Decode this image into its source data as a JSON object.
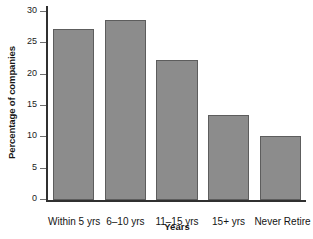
{
  "chart_data": {
    "type": "bar",
    "title": "",
    "xlabel": "Years",
    "ylabel": "Percentage of companies",
    "categories": [
      "Within 5 yrs",
      "6–10 yrs",
      "11–15 yrs",
      "15+ yrs",
      "Never Retire"
    ],
    "values": [
      27.3,
      28.8,
      22.4,
      13.6,
      10.2
    ],
    "ylim": [
      0,
      30
    ],
    "yticks": [
      0,
      5,
      10,
      15,
      20,
      25,
      30
    ],
    "ytick_labels": [
      "0",
      "5",
      "10",
      "15",
      "20",
      "25",
      "30"
    ],
    "grid": false,
    "legend": false,
    "bar_color": "#8c8c8c",
    "bar_border_color": "#5d5d5d",
    "axis_color": "#303030",
    "background": "#ffffff"
  },
  "axis": {
    "y_title": "Percentage of companies",
    "x_title": "Years"
  }
}
